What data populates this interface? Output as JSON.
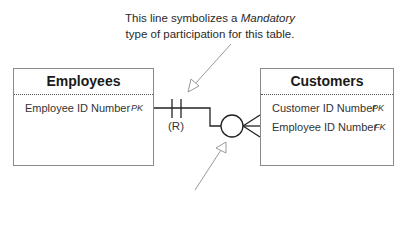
{
  "annotation": {
    "line1_prefix": "This line symbolizes a ",
    "line1_emphasis": "Mandatory",
    "line2": "type of participation for this table."
  },
  "relationship": {
    "label": "(R)",
    "left_participation": "mandatory",
    "left_cardinality": "one",
    "right_participation": "optional",
    "right_cardinality": "many",
    "line_color": "#222222",
    "arrow_color": "#999999"
  },
  "entities": [
    {
      "name": "Employees",
      "fields": [
        {
          "label": "Employee ID Number",
          "key": "PK"
        }
      ]
    },
    {
      "name": "Customers",
      "fields": [
        {
          "label": "Customer ID Number",
          "key": "PK"
        },
        {
          "label": "Employee ID Number",
          "key": "FK"
        }
      ]
    }
  ]
}
